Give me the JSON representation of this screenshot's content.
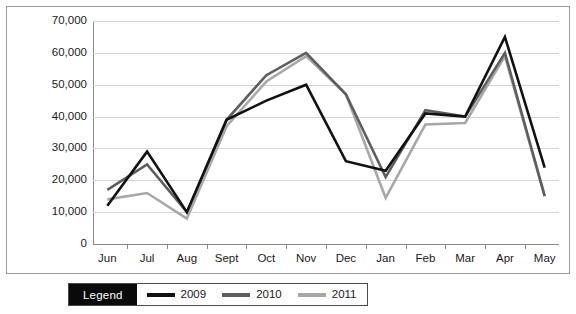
{
  "chart_data": {
    "type": "line",
    "title": "",
    "xlabel": "",
    "ylabel": "",
    "categories": [
      "Jun",
      "Jul",
      "Aug",
      "Sept",
      "Oct",
      "Nov",
      "Dec",
      "Jan",
      "Feb",
      "Mar",
      "Apr",
      "May"
    ],
    "ylim": [
      0,
      70000
    ],
    "ytick_labels": [
      "70,000",
      "60,000",
      "50,000",
      "40,000",
      "30,000",
      "20,000",
      "10,000",
      "0"
    ],
    "ytick_values": [
      70000,
      60000,
      50000,
      40000,
      30000,
      20000,
      10000,
      0
    ],
    "grid": true,
    "legend_position": "bottom-left",
    "series": [
      {
        "name": "2009",
        "color": "#111111",
        "values": [
          12000,
          29000,
          10000,
          39000,
          45000,
          50000,
          26000,
          23000,
          41000,
          40000,
          65000,
          24000
        ]
      },
      {
        "name": "2010",
        "color": "#5e5e5e",
        "values": [
          17000,
          25000,
          10000,
          39000,
          53000,
          60000,
          47000,
          21000,
          42000,
          40000,
          60000,
          15000
        ]
      },
      {
        "name": "2011",
        "color": "#a8a8a8",
        "values": [
          14000,
          16000,
          8000,
          37000,
          51000,
          59000,
          47000,
          14500,
          37500,
          38000,
          59000,
          15000
        ]
      }
    ]
  },
  "legend": {
    "title": "Legend",
    "entries": [
      {
        "label": "2009",
        "color": "#111111"
      },
      {
        "label": "2010",
        "color": "#5e5e5e"
      },
      {
        "label": "2011",
        "color": "#a8a8a8"
      }
    ]
  },
  "colors": {
    "background": "#ffffff",
    "border": "#9c9c9c",
    "gridline": "#d4d4d4",
    "axis": "#8a8a8a",
    "text": "#1a1a1a",
    "legend_title_bg": "#0a0a0a",
    "legend_title_fg": "#ffffff"
  }
}
